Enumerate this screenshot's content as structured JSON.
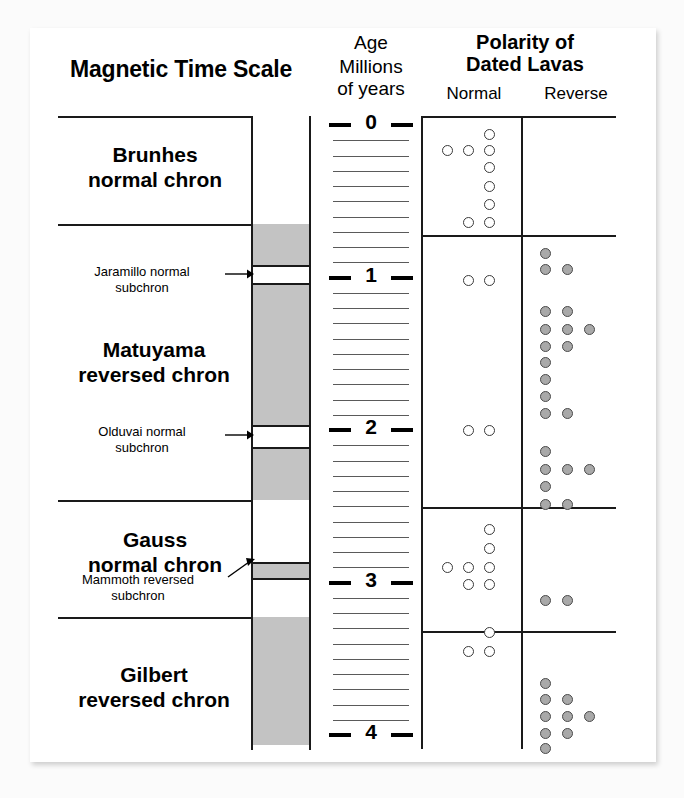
{
  "figure": {
    "left_title": "Magnetic Time Scale",
    "axis_header_line1": "Age",
    "axis_header_line2": "Millions",
    "axis_header_line3": "of years",
    "right_title_line1": "Polarity of",
    "right_title_line2": "Dated Lavas",
    "normal_header": "Normal",
    "reverse_header": "Reverse"
  },
  "colors": {
    "reversed_band": "#c3c3c3",
    "normal_band": "#ffffff",
    "normal_dot_fill": "#ffffff",
    "reverse_dot_fill": "#a9a9a9",
    "line": "#1a1a1a"
  },
  "chart_data": {
    "type": "scatter",
    "ylabel": "Age, Millions of years",
    "ylim": [
      0,
      4.15
    ],
    "y_major_ticks": [
      0,
      1,
      2,
      3,
      4
    ],
    "y_minor_tick_interval": 0.1,
    "grid": false,
    "axis_direction": "downward",
    "chrons": [
      {
        "name": "Brunhes",
        "label_line1": "Brunhes",
        "label_line2": "normal chron",
        "polarity": "normal",
        "start_ma": 0.0,
        "end_ma": 0.78,
        "subchrons": []
      },
      {
        "name": "Matuyama",
        "label_line1": "Matuyama",
        "label_line2": "reversed chron",
        "polarity": "reversed",
        "start_ma": 0.78,
        "end_ma": 2.58,
        "subchrons": [
          {
            "name": "Jaramillo",
            "label_line1": "Jaramillo normal",
            "label_line2": "subchron",
            "polarity": "normal",
            "start_ma": 0.99,
            "end_ma": 1.07
          },
          {
            "name": "Olduvai",
            "label_line1": "Olduvai normal",
            "label_line2": "subchron",
            "polarity": "normal",
            "start_ma": 1.95,
            "end_ma": 2.06
          }
        ]
      },
      {
        "name": "Gauss",
        "label_line1": "Gauss",
        "label_line2": "normal chron",
        "polarity": "normal",
        "start_ma": 2.58,
        "end_ma": 3.58,
        "subchrons": [
          {
            "name": "Mammoth",
            "label_line1": "Mammoth reversed",
            "label_line2": "subchron",
            "polarity": "reversed",
            "start_ma": 3.08,
            "end_ma": 3.18
          }
        ]
      },
      {
        "name": "Gilbert",
        "label_line1": "Gilbert",
        "label_line2": "reversed chron",
        "polarity": "reversed",
        "start_ma": 3.58,
        "end_ma": 4.1,
        "subchrons": []
      }
    ],
    "series": [
      {
        "name": "Normal",
        "marker": "open-circle",
        "points": [
          {
            "col": 2,
            "ma": 0.06
          },
          {
            "col": 0,
            "ma": 0.17
          },
          {
            "col": 1,
            "ma": 0.17
          },
          {
            "col": 2,
            "ma": 0.17
          },
          {
            "col": 2,
            "ma": 0.28
          },
          {
            "col": 2,
            "ma": 0.4
          },
          {
            "col": 2,
            "ma": 0.52
          },
          {
            "col": 1,
            "ma": 0.64
          },
          {
            "col": 2,
            "ma": 0.64
          },
          {
            "col": 1,
            "ma": 1.02
          },
          {
            "col": 2,
            "ma": 1.02
          },
          {
            "col": 1,
            "ma": 2.0
          },
          {
            "col": 2,
            "ma": 2.0
          },
          {
            "col": 2,
            "ma": 2.65
          },
          {
            "col": 2,
            "ma": 2.78
          },
          {
            "col": 0,
            "ma": 2.9
          },
          {
            "col": 1,
            "ma": 2.9
          },
          {
            "col": 2,
            "ma": 2.9
          },
          {
            "col": 1,
            "ma": 3.01
          },
          {
            "col": 2,
            "ma": 3.01
          },
          {
            "col": 2,
            "ma": 3.33
          },
          {
            "col": 1,
            "ma": 3.45
          },
          {
            "col": 2,
            "ma": 3.45
          }
        ]
      },
      {
        "name": "Reverse",
        "marker": "filled-circle",
        "points": [
          {
            "col": 0,
            "ma": 0.84
          },
          {
            "col": 0,
            "ma": 0.95
          },
          {
            "col": 1,
            "ma": 0.95
          },
          {
            "col": 0,
            "ma": 1.22
          },
          {
            "col": 1,
            "ma": 1.22
          },
          {
            "col": 0,
            "ma": 1.34
          },
          {
            "col": 1,
            "ma": 1.34
          },
          {
            "col": 2,
            "ma": 1.34
          },
          {
            "col": 0,
            "ma": 1.45
          },
          {
            "col": 1,
            "ma": 1.45
          },
          {
            "col": 0,
            "ma": 1.56
          },
          {
            "col": 0,
            "ma": 1.67
          },
          {
            "col": 0,
            "ma": 1.78
          },
          {
            "col": 0,
            "ma": 1.89
          },
          {
            "col": 1,
            "ma": 1.89
          },
          {
            "col": 0,
            "ma": 2.14
          },
          {
            "col": 0,
            "ma": 2.26
          },
          {
            "col": 1,
            "ma": 2.26
          },
          {
            "col": 2,
            "ma": 2.26
          },
          {
            "col": 0,
            "ma": 2.37
          },
          {
            "col": 0,
            "ma": 2.49
          },
          {
            "col": 1,
            "ma": 2.49
          },
          {
            "col": 0,
            "ma": 3.12
          },
          {
            "col": 1,
            "ma": 3.12
          },
          {
            "col": 0,
            "ma": 3.66
          },
          {
            "col": 0,
            "ma": 3.77
          },
          {
            "col": 1,
            "ma": 3.77
          },
          {
            "col": 0,
            "ma": 3.88
          },
          {
            "col": 1,
            "ma": 3.88
          },
          {
            "col": 2,
            "ma": 3.88
          },
          {
            "col": 0,
            "ma": 3.99
          },
          {
            "col": 1,
            "ma": 3.99
          },
          {
            "col": 0,
            "ma": 4.09
          },
          {
            "col": 0,
            "ma": 4.19
          }
        ]
      }
    ]
  }
}
